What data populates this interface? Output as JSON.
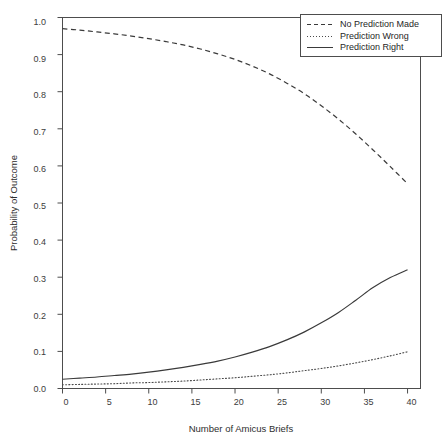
{
  "chart_data": {
    "type": "line",
    "title": "",
    "xlabel": "Number of Amicus Briefs",
    "ylabel": "Probability of Outcome",
    "xlim": [
      0,
      41.5
    ],
    "ylim": [
      0.0,
      1.0
    ],
    "grid": false,
    "legend_position": "top-right",
    "xticks": [
      "0",
      "5",
      "10",
      "15",
      "20",
      "25",
      "30",
      "35",
      "40"
    ],
    "xtick_values": [
      0,
      5,
      10,
      15,
      20,
      25,
      30,
      35,
      40
    ],
    "yticks": [
      "0.0",
      "0.1",
      "0.2",
      "0.3",
      "0.4",
      "0.5",
      "0.6",
      "0.7",
      "0.8",
      "0.9",
      "1.0"
    ],
    "ytick_values": [
      0.0,
      0.1,
      0.2,
      0.3,
      0.4,
      0.5,
      0.6,
      0.7,
      0.8,
      0.9,
      1.0
    ],
    "x": [
      0,
      2,
      4,
      6,
      8,
      10,
      12,
      14,
      16,
      18,
      20,
      22,
      24,
      26,
      28,
      30,
      32,
      34,
      36,
      38,
      40
    ],
    "series": [
      {
        "name": "No Prediction Made",
        "style": "dashed",
        "color": "#3a3a3a",
        "values": [
          0.97,
          0.966,
          0.961,
          0.956,
          0.95,
          0.943,
          0.935,
          0.926,
          0.915,
          0.902,
          0.887,
          0.869,
          0.848,
          0.823,
          0.795,
          0.762,
          0.726,
          0.686,
          0.643,
          0.598,
          0.552
        ]
      },
      {
        "name": "Prediction Wrong",
        "style": "dotted",
        "color": "#4a4a4a",
        "values": [
          0.01,
          0.011,
          0.012,
          0.013,
          0.015,
          0.016,
          0.018,
          0.02,
          0.023,
          0.026,
          0.029,
          0.033,
          0.037,
          0.042,
          0.048,
          0.054,
          0.061,
          0.069,
          0.078,
          0.088,
          0.099
        ]
      },
      {
        "name": "Prediction Right",
        "style": "solid",
        "color": "#3a3a3a",
        "values": [
          0.025,
          0.028,
          0.031,
          0.035,
          0.039,
          0.044,
          0.05,
          0.057,
          0.065,
          0.074,
          0.085,
          0.098,
          0.113,
          0.131,
          0.152,
          0.177,
          0.205,
          0.238,
          0.272,
          0.299,
          0.32
        ]
      }
    ]
  },
  "axes": {
    "y_title": "Probability of Outcome",
    "x_title": "Number of Amicus Briefs",
    "y_labels": [
      "1.0",
      "0.9",
      "0.8",
      "0.7",
      "0.6",
      "0.5",
      "0.4",
      "0.3",
      "0.2",
      "0.1",
      "0.0"
    ],
    "x_labels": [
      "0",
      "5",
      "10",
      "15",
      "20",
      "25",
      "30",
      "35",
      "40"
    ]
  },
  "legend": {
    "items": [
      {
        "label": "No Prediction Made",
        "style": "dashed"
      },
      {
        "label": "Prediction Wrong",
        "style": "dotted"
      },
      {
        "label": "Prediction Right",
        "style": "solid"
      }
    ]
  },
  "colors": {
    "line": "#3a3a3a",
    "frame": "#4d4d4d",
    "text": "#1f1f1f",
    "background": "#ffffff"
  }
}
